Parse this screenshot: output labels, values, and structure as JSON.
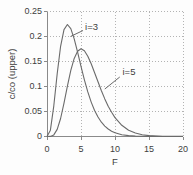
{
  "chart_data": {
    "type": "line",
    "title": "",
    "xlabel": "F",
    "ylabel": "c/co (upper)",
    "xlim": [
      0,
      20
    ],
    "ylim": [
      0,
      0.25
    ],
    "x_ticks": [
      0,
      5,
      10,
      15,
      20
    ],
    "x_tick_labels": [
      "0",
      "5",
      "10",
      "15",
      "20"
    ],
    "y_ticks": [
      0,
      0.05,
      0.1,
      0.15,
      0.2,
      0.25
    ],
    "y_tick_labels": [
      "0",
      "0.05",
      "0.1",
      "0.15",
      "0.2",
      "0.25"
    ],
    "grid": "dotted horizontal and vertical gridlines at every labeled tick",
    "legend_position": "none (inline curve annotations with leader lines)",
    "x": [
      0,
      0.5,
      1,
      1.5,
      2,
      2.5,
      3,
      3.5,
      4,
      4.5,
      5,
      5.5,
      6,
      6.5,
      7,
      7.5,
      8,
      8.5,
      9,
      9.5,
      10,
      11,
      12,
      13,
      14,
      15,
      16,
      17,
      18,
      19,
      20
    ],
    "series": [
      {
        "name": "i=3",
        "values": [
          0,
          0.0126,
          0.0613,
          0.1255,
          0.1804,
          0.2138,
          0.224,
          0.2158,
          0.1954,
          0.1687,
          0.1404,
          0.1133,
          0.0892,
          0.0688,
          0.0521,
          0.0389,
          0.0286,
          0.0208,
          0.015,
          0.0107,
          0.0076,
          0.0037,
          0.0018,
          0.0008,
          0.0004,
          0.0002,
          0.0001,
          0,
          0,
          0,
          0
        ],
        "peak": {
          "x": 3,
          "y": 0.224
        }
      },
      {
        "name": "i=5",
        "values": [
          0,
          0.0002,
          0.0031,
          0.0141,
          0.0361,
          0.0668,
          0.1008,
          0.1322,
          0.1563,
          0.1707,
          0.1755,
          0.1714,
          0.1606,
          0.1454,
          0.1277,
          0.1094,
          0.0916,
          0.0752,
          0.0607,
          0.0483,
          0.0378,
          0.0224,
          0.0127,
          0.007,
          0.0037,
          0.0019,
          0.001,
          0.0005,
          0.0002,
          0.0001,
          0.0001
        ],
        "peak": {
          "x": 5,
          "y": 0.1755
        }
      }
    ],
    "annotations": [
      {
        "label": "i=3",
        "x": 5.6,
        "y": 0.221,
        "leader": [
          5.3,
          0.212,
          3.45,
          0.2
        ]
      },
      {
        "label": "i=5",
        "x": 11.1,
        "y": 0.131,
        "leader": [
          10.7,
          0.119,
          8.5,
          0.095
        ]
      }
    ],
    "colors": {
      "curve": "#6a6a6a",
      "grid": "#b3b3b3",
      "axis": "#8a8a8a",
      "text": "#3d3d3d",
      "background": "#fdfdfd"
    }
  }
}
